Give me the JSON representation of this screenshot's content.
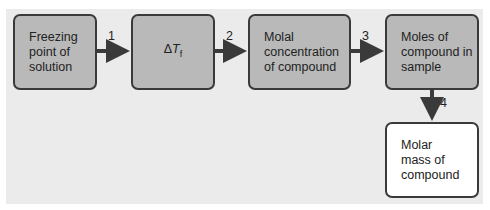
{
  "diagram": {
    "boxes": [
      {
        "id": "freezing-point",
        "text": "Freezing\npoint of\nsolution"
      },
      {
        "id": "delta-tf",
        "symbol": "Δ",
        "var": "T",
        "sub": "f"
      },
      {
        "id": "molal-concentration",
        "text": "Molal\nconcentration\nof compound"
      },
      {
        "id": "moles-compound",
        "text": "Moles of\ncompound in\nsample"
      },
      {
        "id": "molar-mass",
        "text": "Molar\nmass of\ncompound"
      }
    ],
    "arrows": [
      {
        "from": "freezing-point",
        "to": "delta-tf",
        "label": "1"
      },
      {
        "from": "delta-tf",
        "to": "molal-concentration",
        "label": "2"
      },
      {
        "from": "molal-concentration",
        "to": "moles-compound",
        "label": "3"
      },
      {
        "from": "moles-compound",
        "to": "molar-mass",
        "label": "4"
      }
    ],
    "colors": {
      "box_fill": "#b9b9b9",
      "final_box_fill": "#ffffff",
      "background": "#ebebeb",
      "stroke": "#3a3a3a"
    }
  }
}
